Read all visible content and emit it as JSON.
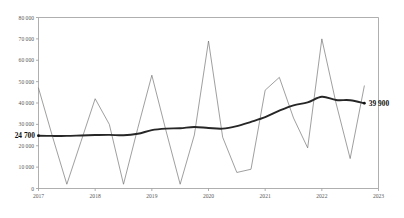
{
  "chart_data": {
    "type": "line",
    "title": "",
    "subtitle": "",
    "xlabel": "",
    "ylabel": "",
    "xlim": [
      2017,
      2023
    ],
    "ylim": [
      0,
      80000
    ],
    "grid": false,
    "legend": null,
    "y_ticks": [
      "0",
      "10 000",
      "20 000",
      "30 000",
      "40 000",
      "50 000",
      "60 000",
      "70 000",
      "80 000"
    ],
    "y_tick_values": [
      0,
      10000,
      20000,
      30000,
      40000,
      50000,
      60000,
      70000,
      80000
    ],
    "x_ticks": [
      "2017",
      "2018",
      "2019",
      "2020",
      "2021",
      "2022",
      "2023"
    ],
    "x_tick_values": [
      2017,
      2018,
      2019,
      2020,
      2021,
      2022,
      2023
    ],
    "annotations": [
      {
        "name": "start-value",
        "text": "24 700",
        "x": 2017,
        "y": 24700
      },
      {
        "name": "end-value",
        "text": "39 900",
        "x": 2022.75,
        "y": 39900
      }
    ],
    "series": [
      {
        "name": "quarterly",
        "style": "thin",
        "color": "#6b6b6b",
        "x": [
          2017.0,
          2017.25,
          2017.5,
          2017.75,
          2018.0,
          2018.25,
          2018.5,
          2018.75,
          2019.0,
          2019.25,
          2019.5,
          2019.75,
          2020.0,
          2020.25,
          2020.5,
          2020.75,
          2021.0,
          2021.25,
          2021.5,
          2021.75,
          2022.0,
          2022.25,
          2022.5,
          2022.75
        ],
        "values": [
          47000,
          24000,
          2000,
          22000,
          42000,
          30000,
          2000,
          28000,
          53000,
          27000,
          2000,
          25000,
          69000,
          24000,
          7500,
          9000,
          46000,
          52000,
          33000,
          19000,
          70000,
          40000,
          14000,
          48000
        ]
      },
      {
        "name": "trend",
        "style": "thick",
        "color": "#262626",
        "x": [
          2017.0,
          2017.25,
          2017.5,
          2017.75,
          2018.0,
          2018.25,
          2018.5,
          2018.75,
          2019.0,
          2019.25,
          2019.5,
          2019.75,
          2020.0,
          2020.25,
          2020.5,
          2020.75,
          2021.0,
          2021.25,
          2021.5,
          2021.75,
          2022.0,
          2022.25,
          2022.5,
          2022.75
        ],
        "values": [
          24700,
          24600,
          24600,
          24800,
          25000,
          25100,
          24900,
          25600,
          27300,
          28000,
          28200,
          28800,
          28300,
          28000,
          29200,
          31200,
          33400,
          36400,
          38900,
          40300,
          42900,
          41400,
          41300,
          39900
        ]
      }
    ]
  }
}
